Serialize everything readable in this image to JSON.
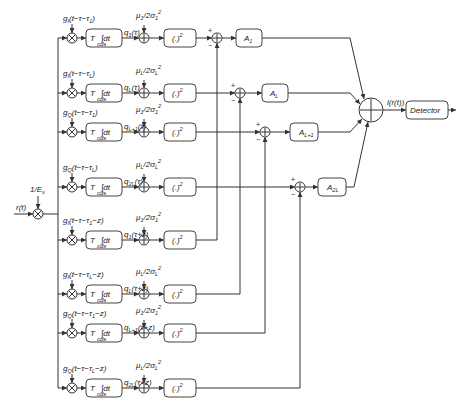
{
  "diagram": {
    "input_label": "r(t)",
    "scale_label": "1/E_s",
    "integrator_label": "∫dt",
    "integrator_prefix": "T",
    "integrator_sub": "cds",
    "square_label": "(.)²",
    "summer_output_label": "l(r(t))",
    "detector_label": "Detector",
    "plus_sign": "+",
    "minus_sign": "−",
    "branches": [
      {
        "ref": "g_I(t−τ−τ_1)",
        "q": "q_1(τ)",
        "bias": "μ_1/2σ_1²"
      },
      {
        "ref": "g_I(t−τ−τ_L)",
        "q": "q_L(τ)",
        "bias": "μ_L/2σ_L²"
      },
      {
        "ref": "g_Q(t−τ−τ_1)",
        "q": "q_L+1(τ)",
        "bias": "μ_1/2σ_1²"
      },
      {
        "ref": "g_Q(t−τ−τ_L)",
        "q": "q_2L(τ)",
        "bias": "μ_L/2σ_L²"
      },
      {
        "ref": "g_I(t−τ−τ_1−z)",
        "q": "q_1(τ+z)",
        "bias": "μ_1/2σ_1²"
      },
      {
        "ref": "g_I(t−τ−τ_L−z)",
        "q": "q_L(τ+z)",
        "bias": "μ_L/2σ_L²"
      },
      {
        "ref": "g_Q(t−τ−τ_1−z)",
        "q": "q_L+1(τ+z)",
        "bias": "μ_1/2σ_1²"
      },
      {
        "ref": "g_Q(t−τ−τ_L−z)",
        "q": "q_2L(τ+z)",
        "bias": "μ_L/2σ_L²"
      }
    ],
    "gains": [
      "A_1",
      "A_L",
      "A_L+1",
      "A_2L"
    ]
  }
}
